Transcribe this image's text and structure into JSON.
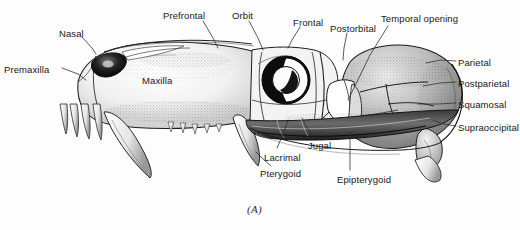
{
  "figure": {
    "kind": "anatomical-illustration",
    "caption": "(A)",
    "background_color": "#fdfdfd",
    "ink_color": "#181818",
    "label_color": "#181818",
    "leader_color": "#303030"
  },
  "labels": [
    {
      "id": "premaxilla",
      "text": "Premaxilla",
      "x": 4,
      "y": 64,
      "anchor": "start"
    },
    {
      "id": "nasal",
      "text": "Nasal",
      "x": 59,
      "y": 28,
      "anchor": "start"
    },
    {
      "id": "prefrontal",
      "text": "Prefrontal",
      "x": 163,
      "y": 10,
      "anchor": "start"
    },
    {
      "id": "orbit",
      "text": "Orbit",
      "x": 232,
      "y": 10,
      "anchor": "start"
    },
    {
      "id": "frontal",
      "text": "Frontal",
      "x": 293,
      "y": 17,
      "anchor": "start"
    },
    {
      "id": "postorbital",
      "text": "Postorbital",
      "x": 330,
      "y": 23,
      "anchor": "start"
    },
    {
      "id": "temporal-opening",
      "text": "Temporal opening",
      "x": 381,
      "y": 13,
      "anchor": "start"
    },
    {
      "id": "parietal",
      "text": "Parietal",
      "x": 458,
      "y": 57,
      "anchor": "start"
    },
    {
      "id": "postparietal",
      "text": "Postparietal",
      "x": 458,
      "y": 78,
      "anchor": "start"
    },
    {
      "id": "squamosal",
      "text": "Squamosal",
      "x": 458,
      "y": 99,
      "anchor": "start"
    },
    {
      "id": "supraoccipital",
      "text": "Supraoccipital",
      "x": 458,
      "y": 122,
      "anchor": "start"
    },
    {
      "id": "maxilla",
      "text": "Maxilla",
      "x": 142,
      "y": 75,
      "anchor": "start"
    },
    {
      "id": "lacrimal",
      "text": "Lacrimal",
      "x": 264,
      "y": 152,
      "anchor": "start"
    },
    {
      "id": "pterygoid",
      "text": "Pterygoid",
      "x": 260,
      "y": 168,
      "anchor": "start"
    },
    {
      "id": "jugal",
      "text": "Jugal",
      "x": 308,
      "y": 140,
      "anchor": "start"
    },
    {
      "id": "epipterygoid",
      "text": "Epipterygoid",
      "x": 337,
      "y": 174,
      "anchor": "start"
    }
  ],
  "leader_lines": [
    {
      "id": "leader-premaxilla",
      "points": "62,68 78,74 86,80"
    },
    {
      "id": "leader-nasal",
      "points": "82,37 92,48 96,54"
    },
    {
      "id": "leader-prefrontal",
      "points": "203,21 213,38 218,48"
    },
    {
      "id": "leader-orbit",
      "points": "249,21 258,38 263,50"
    },
    {
      "id": "leader-frontal",
      "points": "300,27 292,40 288,48"
    },
    {
      "id": "leader-postorbital",
      "points": "347,33 344,48 343,60"
    },
    {
      "id": "leader-temporal-opening",
      "points": "388,26 370,55 354,88 348,100"
    },
    {
      "id": "leader-parietal",
      "points": "456,61 441,60 426,63"
    },
    {
      "id": "leader-postparietal",
      "points": "456,82 440,83 423,86"
    },
    {
      "id": "leader-squamosal",
      "points": "456,103 438,104 418,104"
    },
    {
      "id": "leader-supraoccipital",
      "points": "456,126 443,124 433,120"
    },
    {
      "id": "leader-lacrimal",
      "points": "277,148 284,132 288,120"
    },
    {
      "id": "leader-pterygoid",
      "points": "271,166 262,158 256,152"
    },
    {
      "id": "leader-jugal",
      "points": "313,136 306,126 302,118"
    },
    {
      "id": "leader-epipterygoid",
      "points": "350,170 350,150 350,132"
    }
  ]
}
